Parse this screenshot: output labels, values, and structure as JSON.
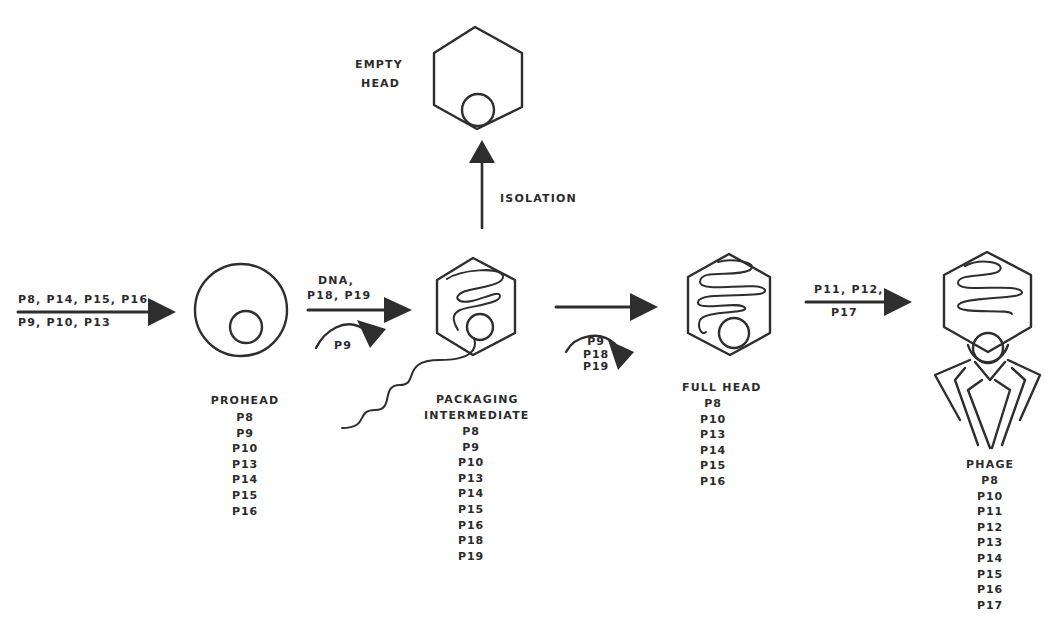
{
  "diagram": {
    "stages": [
      {
        "id": "prohead",
        "label": "PROHEAD",
        "proteins": [
          "P8",
          "P9",
          "P10",
          "P13",
          "P14",
          "P15",
          "P16"
        ]
      },
      {
        "id": "packaging-intermediate",
        "label_lines": [
          "PACKAGING",
          "INTERMEDIATE"
        ],
        "proteins": [
          "P8",
          "P9",
          "P10",
          "P13",
          "P14",
          "P15",
          "P16",
          "P18",
          "P19"
        ]
      },
      {
        "id": "full-head",
        "label": "FULL HEAD",
        "proteins": [
          "P8",
          "P10",
          "P13",
          "P14",
          "P15",
          "P16"
        ]
      },
      {
        "id": "phage",
        "label": "PHAGE",
        "proteins": [
          "P8",
          "P10",
          "P11",
          "P12",
          "P13",
          "P14",
          "P15",
          "P16",
          "P17"
        ]
      },
      {
        "id": "empty-head",
        "label_lines": [
          "EMPTY",
          "HEAD"
        ]
      }
    ],
    "arrows": {
      "input": {
        "above": "P8, P14, P15, P16",
        "below": "P9, P10, P13"
      },
      "prohead_to_packaging": {
        "above_lines": [
          "DNA,",
          "P18, P19"
        ],
        "released": "P9"
      },
      "packaging_to_fullhead": {
        "released_lines": [
          "P9",
          "P18",
          "P19"
        ]
      },
      "fullhead_to_phage": {
        "above": "P11, P12,",
        "below": "P17"
      },
      "isolation": {
        "label": "ISOLATION"
      }
    }
  }
}
